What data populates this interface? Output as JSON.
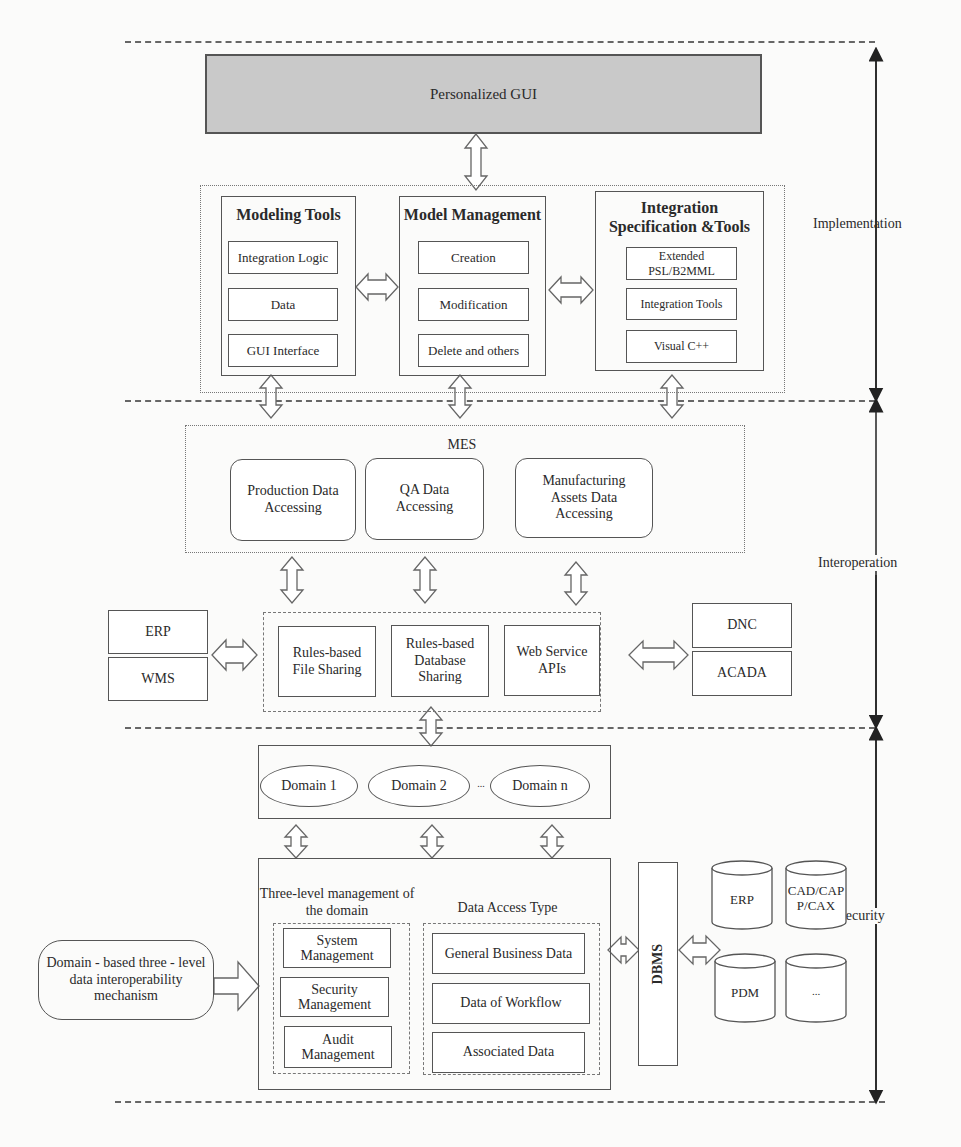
{
  "layers": {
    "implementation": "Implementation",
    "interoperation": "Interoperation",
    "security": "Security"
  },
  "gui": {
    "label": "Personalized GUI"
  },
  "implementation": {
    "modeling_tools": {
      "title": "Modeling Tools",
      "items": [
        "Integration Logic",
        "Data",
        "GUI Interface"
      ]
    },
    "model_management": {
      "title": "Model Management",
      "items": [
        "Creation",
        "Modification",
        "Delete and others"
      ]
    },
    "integration_spec": {
      "title_line1": "Integration",
      "title_line2": "Specification &Tools",
      "items": [
        "Extended PSL/B2MML",
        "Integration Tools",
        "Visual C++"
      ]
    }
  },
  "mes": {
    "title": "MES",
    "items": [
      "Production Data Accessing",
      "QA Data Accessing",
      "Manufacturing Assets Data Accessing"
    ]
  },
  "sharing": {
    "items": [
      "Rules-based File Sharing",
      "Rules-based Database Sharing",
      "Web Service APIs"
    ]
  },
  "left_systems": [
    "ERP",
    "WMS"
  ],
  "right_systems": [
    "DNC",
    "ACADA"
  ],
  "domains": {
    "items": [
      "Domain 1",
      "Domain 2",
      "Domain n"
    ],
    "ellipsis": "..."
  },
  "three_level": {
    "title": "Three-level management of the domain",
    "items": [
      "System Management",
      "Security Management",
      "Audit Management"
    ]
  },
  "data_access": {
    "title": "Data Access Type",
    "items": [
      "General Business Data",
      "Data of Workflow",
      "Associated Data"
    ]
  },
  "mechanism": {
    "label": "Domain - based three - level data interoperability mechanism"
  },
  "dbms": {
    "label": "DBMS"
  },
  "databases": [
    "ERP",
    "CAD/CAP P/CAX",
    "PDM",
    "..."
  ]
}
